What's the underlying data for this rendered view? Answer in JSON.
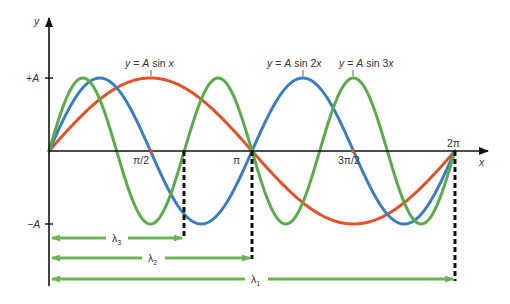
{
  "figure": {
    "axes": {
      "x_label": "x",
      "y_label": "y",
      "y_ticks": [
        {
          "label": "+A",
          "value": 1
        },
        {
          "label": "−A",
          "value": -1
        }
      ],
      "x_ticks": [
        {
          "label": "π/2",
          "value": 1.5708
        },
        {
          "label": "π",
          "value": 3.1416
        },
        {
          "label": "3π/2",
          "value": 4.7124
        },
        {
          "label": "2π",
          "value": 6.2832
        }
      ]
    },
    "curve_labels": {
      "sin1": "y = A sin x",
      "sin2": "y = A sin 2x",
      "sin3": "y = A sin 3x"
    },
    "wavelength_labels": {
      "l3": "λ",
      "l3_sub": "3",
      "l2": "λ",
      "l2_sub": "2",
      "l1": "λ",
      "l1_sub": "1"
    },
    "colors": {
      "sin1": "#e2522b",
      "sin2": "#3c7dbf",
      "sin3": "#5bab4b",
      "axis": "#111111",
      "arrow": "#6cb556"
    }
  },
  "chart_data": {
    "type": "line",
    "title": "",
    "xlabel": "x",
    "ylabel": "y",
    "xlim": [
      0,
      6.2832
    ],
    "ylim": [
      -1,
      1
    ],
    "series": [
      {
        "name": "y = A sin x",
        "function": "sin(x)",
        "wavelength": "2π"
      },
      {
        "name": "y = A sin 2x",
        "function": "sin(2x)",
        "wavelength": "π"
      },
      {
        "name": "y = A sin 3x",
        "function": "sin(3x)",
        "wavelength": "2π/3"
      }
    ],
    "annotations": [
      "λ1 = 2π",
      "λ2 = π",
      "λ3 = 2π/3"
    ]
  }
}
